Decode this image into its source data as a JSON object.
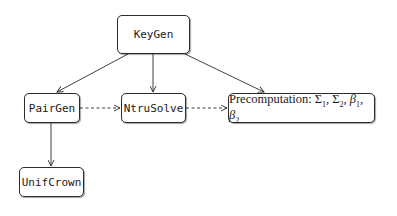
{
  "diagram": {
    "nodes": {
      "keygen": {
        "label": "KeyGen"
      },
      "pairgen": {
        "label": "PairGen"
      },
      "ntrusolve": {
        "label": "NtruSolve"
      },
      "precomputation": {
        "prefix": "Precomputation: ",
        "sym1": "Σ",
        "sub1": "1",
        "sep1": ", ",
        "sym2": "Σ",
        "sub2": "2",
        "sep2": ", ",
        "sym3": "β",
        "sub3": "1",
        "sep3": ", ",
        "sym4": "β",
        "sub4": "2"
      },
      "unifcrown": {
        "label": "UnifCrown"
      }
    },
    "edges": [
      {
        "from": "KeyGen",
        "to": "PairGen",
        "style": "solid"
      },
      {
        "from": "KeyGen",
        "to": "NtruSolve",
        "style": "solid"
      },
      {
        "from": "KeyGen",
        "to": "Precomputation",
        "style": "solid"
      },
      {
        "from": "PairGen",
        "to": "NtruSolve",
        "style": "dashed"
      },
      {
        "from": "NtruSolve",
        "to": "Precomputation",
        "style": "dashed"
      },
      {
        "from": "PairGen",
        "to": "UnifCrown",
        "style": "solid"
      }
    ],
    "colors": {
      "stroke": "#2b2b2b",
      "background": "#ffffff",
      "text": "#1a1a1a"
    }
  }
}
